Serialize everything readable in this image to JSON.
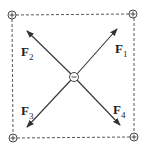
{
  "diagram": {
    "charges": {
      "corners": [
        "+",
        "+",
        "+",
        "+"
      ],
      "center": "−"
    },
    "forces": [
      {
        "base": "F",
        "sub": "1"
      },
      {
        "base": "F",
        "sub": "2"
      },
      {
        "base": "F",
        "sub": "3"
      },
      {
        "base": "F",
        "sub": "4"
      }
    ],
    "colors": {
      "stroke": "#333333",
      "background": "#ffffff"
    }
  }
}
